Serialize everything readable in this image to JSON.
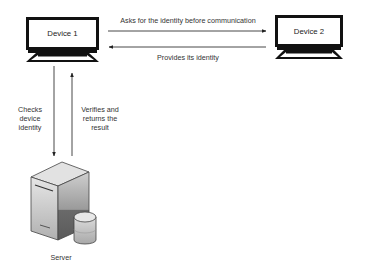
{
  "diagram": {
    "nodes": {
      "device1": {
        "label": "Device 1"
      },
      "device2": {
        "label": "Device 2"
      },
      "server": {
        "label": "Server"
      }
    },
    "edges": {
      "ask_identity": {
        "label": "Asks for the identity before communication",
        "from": "Device 1",
        "to": "Device 2"
      },
      "provide_identity": {
        "label": "Provides its identity",
        "from": "Device 2",
        "to": "Device 1"
      },
      "check_identity": {
        "label_lines": [
          "Checks",
          "device",
          "identity"
        ],
        "from": "Device 1",
        "to": "Server"
      },
      "verify_result": {
        "label_lines": [
          "Verifies and",
          "returns the",
          "result"
        ],
        "from": "Server",
        "to": "Device 1"
      }
    }
  },
  "colors": {
    "outline": "#111111",
    "arrow": "#333333",
    "server_light": "#d9d9d9",
    "server_mid": "#bdbdbd",
    "server_dark": "#6e6e6e"
  }
}
